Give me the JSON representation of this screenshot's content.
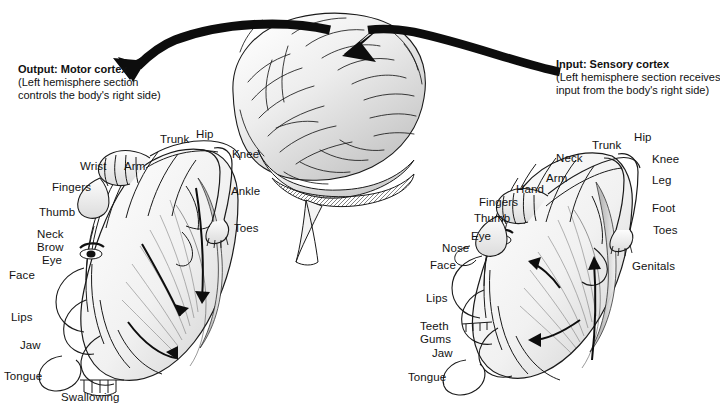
{
  "figure": {
    "background": "#ffffff",
    "ink_color": "#1a1a1a"
  },
  "callouts": {
    "left": {
      "name": "motor-cortex-callout",
      "heading": "Output: Motor cortex",
      "line1": "(Left hemisphere section",
      "line2": "controls the body's right side)"
    },
    "right": {
      "name": "sensory-cortex-callout",
      "heading": "Input: Sensory cortex",
      "line1": "(Left hemisphere section receives",
      "line2": "input from the body's right side)"
    }
  },
  "brain": {
    "name": "lateral-brain-illustration",
    "caption": ""
  },
  "motor_homunculus": {
    "name": "motor-homunculus",
    "labels": [
      {
        "text": "Trunk",
        "x": 160,
        "y": 133
      },
      {
        "text": "Hip",
        "x": 196,
        "y": 128
      },
      {
        "text": "Knee",
        "x": 232,
        "y": 148
      },
      {
        "text": "Wrist",
        "x": 80,
        "y": 160
      },
      {
        "text": "Arm",
        "x": 124,
        "y": 160
      },
      {
        "text": "Fingers",
        "x": 52,
        "y": 181
      },
      {
        "text": "Ankle",
        "x": 231,
        "y": 185
      },
      {
        "text": "Thumb",
        "x": 39,
        "y": 206
      },
      {
        "text": "Toes",
        "x": 234,
        "y": 222
      },
      {
        "text": "Neck",
        "x": 37,
        "y": 228
      },
      {
        "text": "Brow",
        "x": 37,
        "y": 241
      },
      {
        "text": "Eye",
        "x": 42,
        "y": 254
      },
      {
        "text": "Face",
        "x": 9,
        "y": 269
      },
      {
        "text": "Lips",
        "x": 11,
        "y": 311
      },
      {
        "text": "Jaw",
        "x": 20,
        "y": 339
      },
      {
        "text": "Tongue",
        "x": 4,
        "y": 370
      },
      {
        "text": "Swallowing",
        "x": 61,
        "y": 391
      }
    ]
  },
  "sensory_homunculus": {
    "name": "sensory-homunculus",
    "labels": [
      {
        "text": "Trunk",
        "x": 592,
        "y": 139
      },
      {
        "text": "Hip",
        "x": 634,
        "y": 131
      },
      {
        "text": "Neck",
        "x": 556,
        "y": 152
      },
      {
        "text": "Knee",
        "x": 652,
        "y": 153
      },
      {
        "text": "Arm",
        "x": 546,
        "y": 172
      },
      {
        "text": "Leg",
        "x": 652,
        "y": 174
      },
      {
        "text": "Hand",
        "x": 516,
        "y": 183
      },
      {
        "text": "Fingers",
        "x": 479,
        "y": 196
      },
      {
        "text": "Foot",
        "x": 652,
        "y": 202
      },
      {
        "text": "Thumb",
        "x": 474,
        "y": 212
      },
      {
        "text": "Toes",
        "x": 653,
        "y": 224
      },
      {
        "text": "Eye",
        "x": 471,
        "y": 230
      },
      {
        "text": "Nose",
        "x": 442,
        "y": 242
      },
      {
        "text": "Face",
        "x": 430,
        "y": 259
      },
      {
        "text": "Genitals",
        "x": 632,
        "y": 260
      },
      {
        "text": "Lips",
        "x": 426,
        "y": 292
      },
      {
        "text": "Teeth",
        "x": 420,
        "y": 320
      },
      {
        "text": "Gums",
        "x": 420,
        "y": 333
      },
      {
        "text": "Jaw",
        "x": 432,
        "y": 347
      },
      {
        "text": "Tongue",
        "x": 408,
        "y": 371
      }
    ]
  }
}
